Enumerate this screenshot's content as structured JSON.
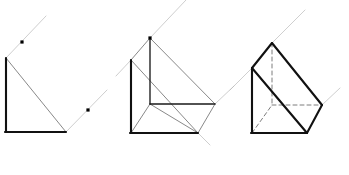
{
  "page": {
    "title": "Oblique projection construction of a triangular prism — three stages",
    "background_color": "#ffffff",
    "width": 349,
    "height": 175
  },
  "style": {
    "bold_stroke_color": "#111111",
    "bold_stroke_width": 2.1,
    "medium_stroke_color": "#1a1a1a",
    "medium_stroke_width": 1.35,
    "thin_stroke_color": "#555555",
    "thin_stroke_width": 0.7,
    "construction_stroke_color": "#b9b9b9",
    "construction_stroke_width": 0.7,
    "hidden_stroke_color": "#6e6e6e",
    "hidden_stroke_width": 0.9,
    "hidden_dash": "4 3",
    "dot_color": "#000000",
    "dot_size": 3.2
  },
  "figures": [
    {
      "id": "figure-1",
      "name": "stage-1-axes-and-points",
      "label": "Stage 1: base axes, hypotenuse and two marked points on 45° rays",
      "bold_lines": [
        {
          "name": "vertical-axis",
          "x1": 6,
          "y1": 58,
          "x2": 6,
          "y2": 132
        },
        {
          "name": "horizontal-axis",
          "x1": 5,
          "y1": 132,
          "x2": 66,
          "y2": 132
        }
      ],
      "thin_lines": [
        {
          "name": "hypotenuse",
          "x1": 6,
          "y1": 58,
          "x2": 66,
          "y2": 132
        }
      ],
      "construction_rays": [
        {
          "name": "upper-45-ray",
          "x1": 6,
          "y1": 58,
          "x2": 46,
          "y2": 16
        },
        {
          "name": "lower-45-ray",
          "x1": 66,
          "y1": 132,
          "x2": 107,
          "y2": 90
        }
      ],
      "points": [
        {
          "name": "point-upper",
          "x": 22,
          "y": 42
        },
        {
          "name": "point-lower",
          "x": 88,
          "y": 110
        }
      ]
    },
    {
      "id": "figure-2",
      "name": "stage-2-edges-added",
      "label": "Stage 2: depth edges drawn to the two points, prism outline emerging",
      "bold_lines": [
        {
          "name": "front-vertical-edge",
          "x1": 131,
          "y1": 60,
          "x2": 131,
          "y2": 133
        },
        {
          "name": "front-horizontal-edge",
          "x1": 130,
          "y1": 133,
          "x2": 198,
          "y2": 133
        }
      ],
      "medium_lines": [
        {
          "name": "apex-vertical-line",
          "x1": 150,
          "y1": 38,
          "x2": 150,
          "y2": 104
        },
        {
          "name": "center-horizontal-line",
          "x1": 150,
          "y1": 104,
          "x2": 215,
          "y2": 104
        }
      ],
      "thin_lines": [
        {
          "name": "front-hypotenuse",
          "x1": 131,
          "y1": 60,
          "x2": 198,
          "y2": 133
        },
        {
          "name": "left-depth-edge",
          "x1": 131,
          "y1": 60,
          "x2": 150,
          "y2": 38
        },
        {
          "name": "top-slope-edge",
          "x1": 150,
          "y1": 38,
          "x2": 215,
          "y2": 104
        },
        {
          "name": "bottom-depth-edge",
          "x1": 198,
          "y1": 133,
          "x2": 215,
          "y2": 104
        },
        {
          "name": "inner-diagonal",
          "x1": 131,
          "y1": 133,
          "x2": 150,
          "y2": 104
        },
        {
          "name": "base-far-edge",
          "x1": 150,
          "y1": 104,
          "x2": 198,
          "y2": 133
        }
      ],
      "construction_rays": [
        {
          "name": "apex-45-ray",
          "x1": 150,
          "y1": 38,
          "x2": 186,
          "y2": 0
        },
        {
          "name": "left-45-ray",
          "x1": 131,
          "y1": 60,
          "x2": 116,
          "y2": 76
        },
        {
          "name": "right-45-ray",
          "x1": 215,
          "y1": 104,
          "x2": 234,
          "y2": 86
        },
        {
          "name": "bottom-45-ray",
          "x1": 198,
          "y1": 133,
          "x2": 210,
          "y2": 145
        }
      ],
      "points": [
        {
          "name": "apex-point",
          "x": 150,
          "y": 38
        }
      ]
    },
    {
      "id": "figure-3",
      "name": "stage-3-completed-prism",
      "label": "Stage 3: completed triangular prism with hidden edges dashed",
      "bold_lines": [
        {
          "name": "front-left-slope",
          "x1": 252,
          "y1": 68,
          "x2": 272,
          "y2": 43
        },
        {
          "name": "front-vertical-edge",
          "x1": 252,
          "y1": 68,
          "x2": 252,
          "y2": 133
        },
        {
          "name": "front-bottom-edge",
          "x1": 251,
          "y1": 133,
          "x2": 307,
          "y2": 133
        },
        {
          "name": "front-hypotenuse",
          "x1": 252,
          "y1": 68,
          "x2": 307,
          "y2": 133
        },
        {
          "name": "top-slope-edge",
          "x1": 272,
          "y1": 43,
          "x2": 322,
          "y2": 105
        },
        {
          "name": "back-right-edge",
          "x1": 307,
          "y1": 133,
          "x2": 322,
          "y2": 105
        }
      ],
      "thin_lines": [
        {
          "name": "upper-depth-edge",
          "x1": 252,
          "y1": 68,
          "x2": 272,
          "y2": 43
        }
      ],
      "hidden_lines": [
        {
          "name": "hidden-vertical",
          "x1": 272,
          "y1": 43,
          "x2": 272,
          "y2": 105
        },
        {
          "name": "hidden-horizontal",
          "x1": 272,
          "y1": 105,
          "x2": 322,
          "y2": 105
        },
        {
          "name": "hidden-diagonal",
          "x1": 252,
          "y1": 133,
          "x2": 272,
          "y2": 105
        }
      ],
      "construction_rays": [
        {
          "name": "apex-45-ray",
          "x1": 272,
          "y1": 43,
          "x2": 305,
          "y2": 10
        },
        {
          "name": "left-45-ray",
          "x1": 252,
          "y1": 68,
          "x2": 230,
          "y2": 90
        },
        {
          "name": "right-45-ray",
          "x1": 322,
          "y1": 105,
          "x2": 340,
          "y2": 88
        }
      ],
      "points": []
    }
  ]
}
